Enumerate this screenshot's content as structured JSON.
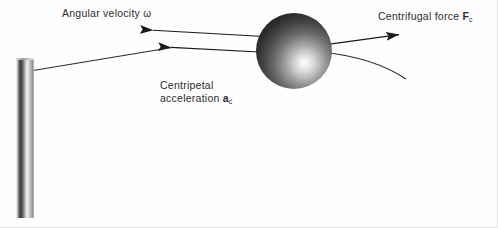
{
  "figure": {
    "background_color": "#ffffff",
    "width": 498,
    "height": 228
  },
  "labels": {
    "angular_velocity": {
      "text": "Angular velocity",
      "symbol": "ω",
      "symbol_name": "omega"
    },
    "centrifugal_force": {
      "text": "Centrifugal force",
      "symbol": "F",
      "subscript": "c"
    },
    "centripetal_acceleration": {
      "line1": "Centripetal",
      "line2": "acceleration",
      "symbol": "a",
      "subscript": "c"
    }
  },
  "objects": {
    "pole": {
      "name": "vertical-pole",
      "shading": "cylindrical-gradient",
      "color_dark": "#3a3a3a",
      "color_light": "#ededed"
    },
    "ball": {
      "name": "rotating-ball",
      "shading": "radial-sphere-gradient",
      "color_dark": "#141414",
      "color_highlight": "#fdfdfd"
    }
  },
  "vectors": {
    "stroke_color": "#1a1a1a",
    "items": [
      {
        "name": "angular-velocity-arrow",
        "direction": "left",
        "from": [
          262,
          36
        ],
        "to": [
          150,
          30
        ]
      },
      {
        "name": "centripetal-acceleration-arrow",
        "direction": "left",
        "from": [
          262,
          52
        ],
        "to": [
          168,
          47
        ]
      },
      {
        "name": "string-to-pole",
        "direction": "none",
        "from": [
          168,
          47
        ],
        "to": [
          33,
          70
        ]
      },
      {
        "name": "centrifugal-force-arrow",
        "direction": "right",
        "from": [
          328,
          44
        ],
        "to": [
          402,
          34
        ]
      },
      {
        "name": "trajectory-curve",
        "direction": "none",
        "from": [
          326,
          54
        ],
        "to": [
          406,
          79
        ]
      }
    ]
  }
}
